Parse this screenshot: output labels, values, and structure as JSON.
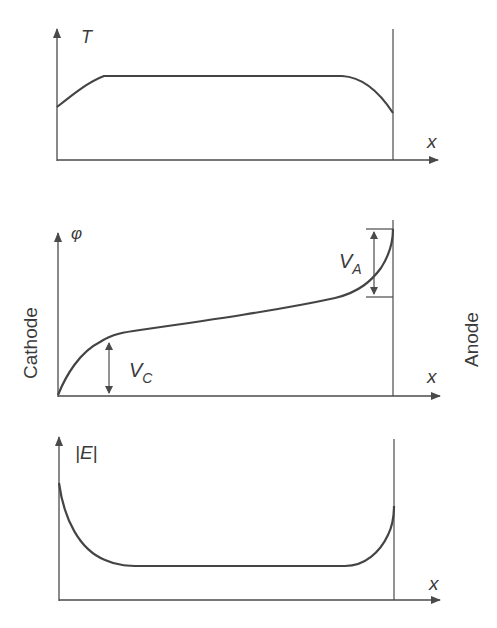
{
  "diagram": {
    "side_labels": {
      "left": "Cathode",
      "right": "Anode"
    },
    "colors": {
      "line": "#4a4a4a",
      "text": "#3a3a3a",
      "background": "#ffffff"
    },
    "panels": [
      {
        "id": "temperature",
        "y_label": "T",
        "x_label": "x",
        "curve": "rises from cathode to plateau, flat in middle, drops near anode"
      },
      {
        "id": "potential",
        "y_label": "φ",
        "x_label": "x",
        "curve": "steep rise near cathode, gradual linear rise in column, steep rise near anode",
        "annotations": [
          {
            "label": "V",
            "subscript": "C",
            "meaning": "cathode fall"
          },
          {
            "label": "V",
            "subscript": "A",
            "meaning": "anode fall"
          }
        ]
      },
      {
        "id": "field",
        "y_label": "|E|",
        "x_label": "x",
        "curve": "high at cathode, decays to flat low value, rises near anode"
      }
    ]
  }
}
